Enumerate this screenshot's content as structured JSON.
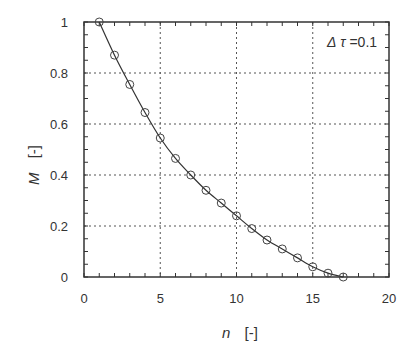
{
  "chart_data": {
    "type": "line",
    "title": "",
    "xlabel": "n",
    "xlabel_unit": "[-]",
    "ylabel": "M",
    "ylabel_unit": "[-]",
    "xlim": [
      0,
      20
    ],
    "ylim": [
      0,
      1
    ],
    "xticks": [
      0,
      5,
      10,
      15,
      20
    ],
    "yticks": [
      0,
      0.2,
      0.4,
      0.6,
      0.8,
      1
    ],
    "ytick_labels": [
      "0",
      "0.2",
      "0.4",
      "0.6",
      "0.8",
      "1"
    ],
    "grid": true,
    "annotation": "Δτ =0.1",
    "series": [
      {
        "name": "M(n)",
        "style": "line with open circle markers",
        "color": "#333333",
        "x": [
          1,
          2,
          3,
          4,
          5,
          6,
          7,
          8,
          9,
          10,
          11,
          12,
          13,
          14,
          15,
          16,
          17
        ],
        "values": [
          1.0,
          0.87,
          0.755,
          0.645,
          0.545,
          0.465,
          0.4,
          0.34,
          0.29,
          0.24,
          0.19,
          0.145,
          0.11,
          0.075,
          0.04,
          0.015,
          0.0
        ]
      }
    ]
  },
  "labels": {
    "xlabel": "n",
    "xunit": "[-]",
    "ylabel": "M",
    "yunit": "[-]",
    "annotation_delta": "Δ",
    "annotation_tau": "τ",
    "annotation_value": " =0.1"
  }
}
